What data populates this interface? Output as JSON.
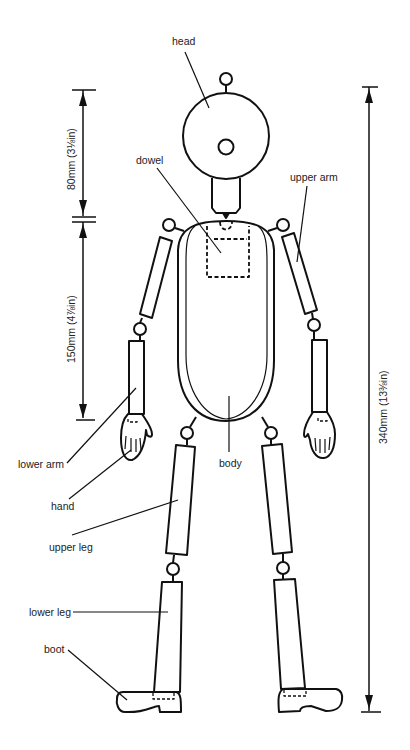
{
  "figure": {
    "stroke_color": "#111111",
    "background": "#ffffff"
  },
  "labels": {
    "head": "head",
    "dowel": "dowel",
    "upper_arm": "upper arm",
    "lower_arm": "lower arm",
    "hand": "hand",
    "body": "body",
    "upper_leg": "upper leg",
    "lower_leg": "lower leg",
    "boot": "boot"
  },
  "dimensions": {
    "head_height": "80mm (3⅛in)",
    "body_height": "150mm (4⅞in)",
    "total_height": "340mm (13⅜in)"
  }
}
